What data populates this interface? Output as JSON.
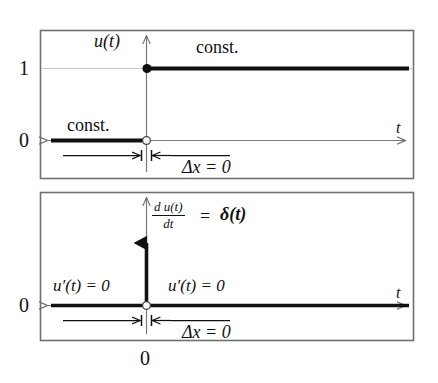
{
  "figure": {
    "background_color": "#ffffff",
    "frame_color": "#6b6b6b",
    "curve_color": "#111111",
    "axis_color": "#7a7a7a",
    "panels": [
      {
        "id": "top-panel",
        "name": "unit-step-panel",
        "y_axis_label": "u(t)",
        "x_axis_label": "t",
        "y_ticks": [
          "1",
          "0"
        ],
        "annotations": [
          "const.",
          "const.",
          "Δx = 0"
        ],
        "step_value_before": "0",
        "step_value_after": "1",
        "left_const_label": "const.",
        "right_const_label": "const.",
        "delta_x_label": "Δx = 0"
      },
      {
        "id": "bottom-panel",
        "name": "derivative-panel",
        "y_axis_label_numerator": "d u(t)",
        "y_axis_label_denominator": "dt",
        "y_axis_label_equals": "=",
        "y_axis_label_delta": "δ(t)",
        "x_axis_label": "t",
        "y_ticks": [
          "0"
        ],
        "x_origin_label": "0",
        "left_value_label": "u′(t) = 0",
        "right_value_label": "u′(t) = 0",
        "delta_x_label": "Δx = 0",
        "impulse": "Dirac delta spike at t = 0"
      }
    ]
  }
}
